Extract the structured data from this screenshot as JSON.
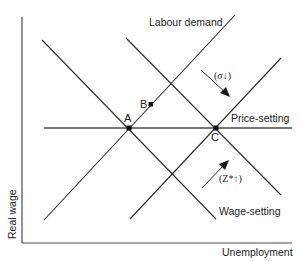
{
  "diagram": {
    "axes": {
      "y_label": "Real wage",
      "x_label": "Unemployment"
    },
    "curves": {
      "labour_demand": "Labour demand",
      "price_setting": "Price-setting",
      "wage_setting": "Wage-setting"
    },
    "points": {
      "a": "A",
      "b": "B",
      "c": "C"
    },
    "annotations": {
      "sigma_shift": "(σ↓)",
      "z_shift": "(Z*↑)"
    }
  }
}
